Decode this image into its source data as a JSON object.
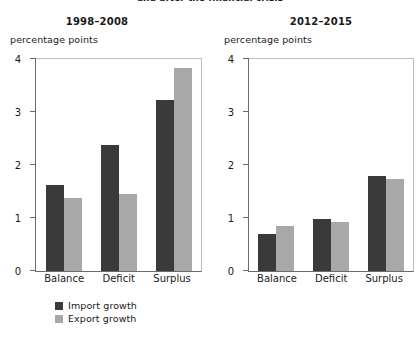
{
  "figure": {
    "headline": "and after the financial crisis"
  },
  "legend": {
    "position": "bottom-left",
    "items": [
      {
        "label": "Import growth",
        "color": "#3a3a3a",
        "key": "import"
      },
      {
        "label": "Export growth",
        "color": "#a8a8a8",
        "key": "export"
      }
    ]
  },
  "chart_data": [
    {
      "type": "bar",
      "title": "1998–2008",
      "ylabel": "percentage points",
      "xlabel": "",
      "categories": [
        "Balance",
        "Deficit",
        "Surplus"
      ],
      "series": [
        {
          "name": "Import growth",
          "color": "#3a3a3a",
          "values": [
            1.62,
            2.38,
            3.23
          ]
        },
        {
          "name": "Export growth",
          "color": "#a8a8a8",
          "values": [
            1.38,
            1.45,
            3.83
          ]
        }
      ],
      "ylim": [
        0,
        4
      ],
      "yticks": [
        0,
        1,
        2,
        3,
        4
      ],
      "grid": false,
      "legend": "bottom-left"
    },
    {
      "type": "bar",
      "title": "2012–2015",
      "ylabel": "percentage points",
      "xlabel": "",
      "categories": [
        "Balance",
        "Deficit",
        "Surplus"
      ],
      "series": [
        {
          "name": "Import growth",
          "color": "#3a3a3a",
          "values": [
            0.7,
            0.98,
            1.8
          ]
        },
        {
          "name": "Export growth",
          "color": "#a8a8a8",
          "values": [
            0.85,
            0.93,
            1.73
          ]
        }
      ],
      "ylim": [
        0,
        4
      ],
      "yticks": [
        0,
        1,
        2,
        3,
        4
      ],
      "grid": false,
      "legend": "none"
    }
  ]
}
